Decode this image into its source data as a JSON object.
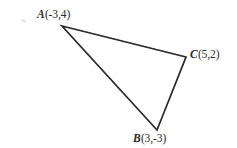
{
  "figure": {
    "canvas": {
      "width": 237,
      "height": 148,
      "background_color": "#ffffff"
    },
    "stroke_color": "#262626",
    "stroke_width": 1.7,
    "text_color": "#2b2b2b",
    "title": "",
    "shape": "triangle"
  },
  "chart_data": {
    "type": "scatter",
    "title": "",
    "xlabel": "",
    "ylabel": "",
    "grid": false,
    "legend": null,
    "shape": "triangle",
    "points": [
      {
        "name": "A",
        "coords": "(-3,4)",
        "x": -3,
        "y": 4,
        "pixel_x": 62,
        "pixel_y": 26
      },
      {
        "name": "B",
        "coords": "(3,-3)",
        "x": 3,
        "y": -3,
        "pixel_x": 157,
        "pixel_y": 130
      },
      {
        "name": "C",
        "coords": "(5,2)",
        "x": 5,
        "y": 2,
        "pixel_x": 186,
        "pixel_y": 57
      }
    ],
    "edges": [
      {
        "from": "A",
        "to": "C"
      },
      {
        "from": "C",
        "to": "B"
      },
      {
        "from": "B",
        "to": "A"
      }
    ],
    "labels": {
      "a": {
        "name": "A",
        "coords": "(-3,4)"
      },
      "b": {
        "name": "B",
        "coords": "(3,-3)"
      },
      "c": {
        "name": "C",
        "coords": "(5,2)"
      }
    }
  }
}
